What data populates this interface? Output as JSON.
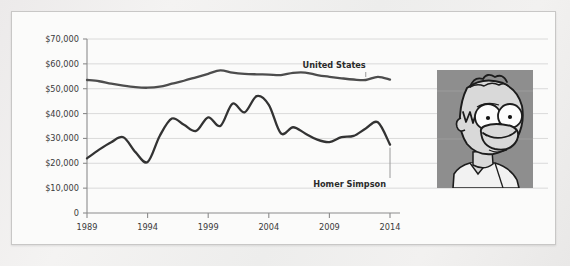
{
  "figure": {
    "background_color": "#fbfbfa",
    "page_background_color": "#eeeded",
    "border_color": "#c8c7c6"
  },
  "portrait": {
    "name": "homer-simpson-portrait",
    "background_color": "#8e8e8e",
    "skin_color": "#d9d9d9",
    "outline_color": "#1c1c1c",
    "alt": "Homer Simpson"
  },
  "chart_data": {
    "type": "line",
    "title": "",
    "xlabel": "",
    "ylabel": "",
    "xlim": [
      1989,
      2014
    ],
    "ylim": [
      0,
      70000
    ],
    "grid": true,
    "grid_axis": "y",
    "legend": "inline-annotations",
    "y_tick_labels": [
      "$70,000",
      "$60,000",
      "$50,000",
      "$40,000",
      "$30,000",
      "$20,000",
      "$10,000",
      "0"
    ],
    "y_tick_values": [
      70000,
      60000,
      50000,
      40000,
      30000,
      20000,
      10000,
      0
    ],
    "x_tick_labels": [
      "1989",
      "1994",
      "1999",
      "2004",
      "2009",
      "2014"
    ],
    "x_tick_values": [
      1989,
      1994,
      1999,
      2004,
      2009,
      2014
    ],
    "x": [
      1989,
      1990,
      1991,
      1992,
      1993,
      1994,
      1995,
      1996,
      1997,
      1998,
      1999,
      2000,
      2001,
      2002,
      2003,
      2004,
      2005,
      2006,
      2007,
      2008,
      2009,
      2010,
      2011,
      2012,
      2013,
      2014
    ],
    "series": [
      {
        "name": "United States",
        "color": "#4d4d4d",
        "annotation_label": "United States",
        "values": [
          53500,
          53000,
          52000,
          51200,
          50600,
          50400,
          50800,
          52000,
          53200,
          54600,
          56000,
          57400,
          56500,
          56000,
          55800,
          55700,
          55500,
          56400,
          56500,
          55500,
          54800,
          54200,
          53700,
          53500,
          54800,
          53700
        ]
      },
      {
        "name": "Homer Simpson",
        "color": "#333333",
        "annotation_label": "Homer Simpson",
        "values": [
          22000,
          25500,
          28500,
          30500,
          24500,
          20500,
          31000,
          38000,
          35500,
          33000,
          38500,
          35000,
          44000,
          40500,
          47000,
          43500,
          32000,
          34500,
          32000,
          29500,
          28500,
          30500,
          31000,
          34000,
          36500,
          27500
        ]
      }
    ],
    "annotations": [
      {
        "text": "United States",
        "series": "United States",
        "at_x": 2012,
        "leader": true
      },
      {
        "text": "Homer Simpson",
        "series": "Homer Simpson",
        "at_x": 2014,
        "leader": true
      }
    ]
  }
}
